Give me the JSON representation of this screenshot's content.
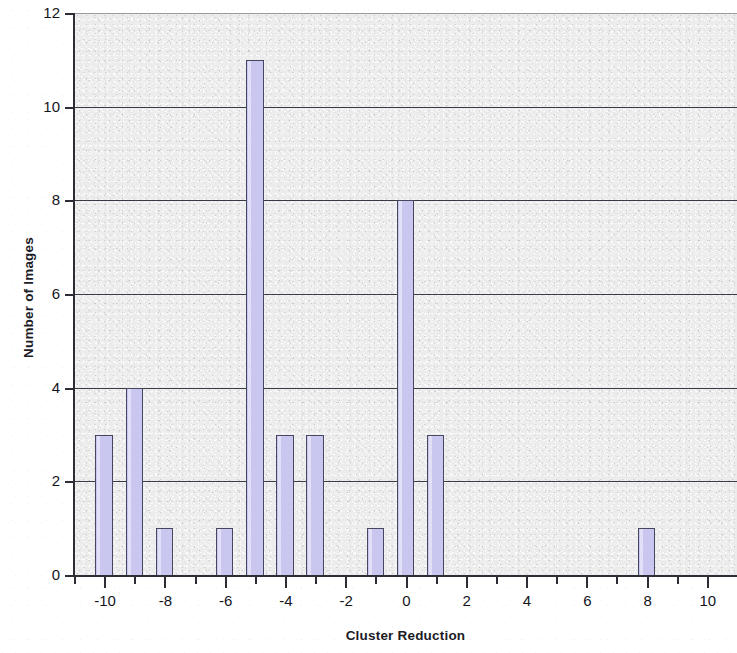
{
  "chart_data": {
    "type": "bar",
    "title": "",
    "subtitle": "",
    "xlabel": "Cluster Reduction",
    "ylabel": "Number of Images",
    "xlim": [
      -11,
      11
    ],
    "ylim": [
      0,
      12
    ],
    "xtick_step": 2,
    "ytick_step": 1,
    "minor_xtick_step": 1,
    "grid": "horizontal",
    "legend": null,
    "legend_position": "none",
    "bar_fill_color": "#c9c7ef",
    "bar_border_color": "#46465e",
    "plot_background_color": "#ececed",
    "gridline_color": "#3a3a44",
    "axis_color": "#2d2d36",
    "text_color": "#15151c",
    "categories": [
      -10,
      -9,
      -8,
      -7,
      -6,
      -5,
      -4,
      -3,
      -2,
      -1,
      0,
      1,
      2,
      3,
      4,
      5,
      6,
      7,
      8,
      9,
      10
    ],
    "values": [
      3,
      4,
      1,
      0,
      1,
      11,
      3,
      3,
      0,
      1,
      8,
      3,
      0,
      0,
      0,
      0,
      0,
      0,
      1,
      0,
      0
    ],
    "bars": [
      {
        "x": -10,
        "y": 3
      },
      {
        "x": -9,
        "y": 4
      },
      {
        "x": -8,
        "y": 1
      },
      {
        "x": -6,
        "y": 1
      },
      {
        "x": -5,
        "y": 11
      },
      {
        "x": -4,
        "y": 3
      },
      {
        "x": -3,
        "y": 3
      },
      {
        "x": -1,
        "y": 1
      },
      {
        "x": 0,
        "y": 8
      },
      {
        "x": 1,
        "y": 3
      },
      {
        "x": 8,
        "y": 1
      }
    ],
    "y_tick_labels": [
      "0",
      "2",
      "4",
      "6",
      "8",
      "10",
      "12"
    ],
    "y_tick_values": [
      0,
      2,
      4,
      6,
      8,
      10,
      12
    ],
    "x_tick_labels": [
      "-10",
      "-8",
      "-6",
      "-4",
      "-2",
      "0",
      "2",
      "4",
      "6",
      "8",
      "10"
    ],
    "x_tick_values": [
      -10,
      -8,
      -6,
      -4,
      -2,
      0,
      2,
      4,
      6,
      8,
      10
    ],
    "x_minor_tick_values": [
      -11,
      -10,
      -9,
      -8,
      -7,
      -6,
      -5,
      -4,
      -3,
      -2,
      -1,
      0,
      1,
      2,
      3,
      4,
      5,
      6,
      7,
      8,
      9,
      10,
      11
    ]
  }
}
